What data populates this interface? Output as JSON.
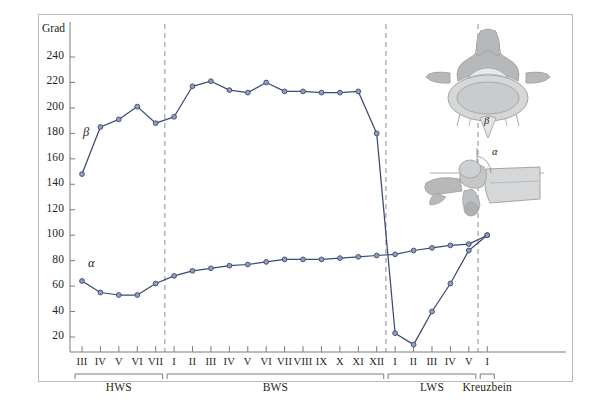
{
  "figure": {
    "unit_label": "Grad",
    "background": "#ffffff",
    "border_color": "#b9b9bb",
    "curve_color": "#3c4a72",
    "marker_fill": "#8f9dbe",
    "divider_color": "#8c8c8e"
  },
  "axes": {
    "y_ticks": [
      240,
      220,
      200,
      180,
      160,
      140,
      120,
      100,
      80,
      60,
      40,
      20
    ],
    "y_min": 0,
    "y_max": 255,
    "x_labels": [
      "III",
      "IV",
      "V",
      "VI",
      "VII",
      "I",
      "II",
      "III",
      "IV",
      "V",
      "VI",
      "VII",
      "VIII",
      "IX",
      "X",
      "XI",
      "XII",
      "I",
      "II",
      "III",
      "IV",
      "V",
      "I"
    ]
  },
  "regions": [
    {
      "name": "HWS",
      "start_index": 0,
      "end_index": 4
    },
    {
      "name": "BWS",
      "start_index": 5,
      "end_index": 16
    },
    {
      "name": "LWS",
      "start_index": 17,
      "end_index": 21
    },
    {
      "name": "Kreuzbein",
      "start_index": 22,
      "end_index": 22
    }
  ],
  "dividers_after_index": [
    4,
    16,
    21
  ],
  "illustrations": {
    "superior_view": {
      "label": "β",
      "name": "vertebra-superior-view"
    },
    "lateral_view": {
      "label": "α",
      "name": "vertebra-lateral-view"
    }
  },
  "chart_data": {
    "type": "line",
    "title": "",
    "xlabel": "",
    "ylabel": "Grad",
    "ylim": [
      0,
      255
    ],
    "grid": false,
    "legend": "inline-curve-labels",
    "categories": [
      "HWS III",
      "HWS IV",
      "HWS V",
      "HWS VI",
      "HWS VII",
      "BWS I",
      "BWS II",
      "BWS III",
      "BWS IV",
      "BWS V",
      "BWS VI",
      "BWS VII",
      "BWS VIII",
      "BWS IX",
      "BWS X",
      "BWS XI",
      "BWS XII",
      "LWS I",
      "LWS II",
      "LWS III",
      "LWS IV",
      "LWS V",
      "Kreuzbein I"
    ],
    "series": [
      {
        "name": "β",
        "label": "β",
        "color": "#3c4a72",
        "values": [
          148,
          185,
          191,
          201,
          188,
          193,
          217,
          221,
          214,
          212,
          220,
          213,
          213,
          212,
          212,
          213,
          180,
          23,
          14,
          40,
          62,
          88,
          100
        ]
      },
      {
        "name": "α",
        "label": "α",
        "color": "#3c4a72",
        "values": [
          64,
          55,
          53,
          53,
          62,
          68,
          72,
          74,
          76,
          77,
          79,
          81,
          81,
          81,
          82,
          83,
          84,
          85,
          88,
          90,
          92,
          93,
          100
        ]
      }
    ]
  }
}
